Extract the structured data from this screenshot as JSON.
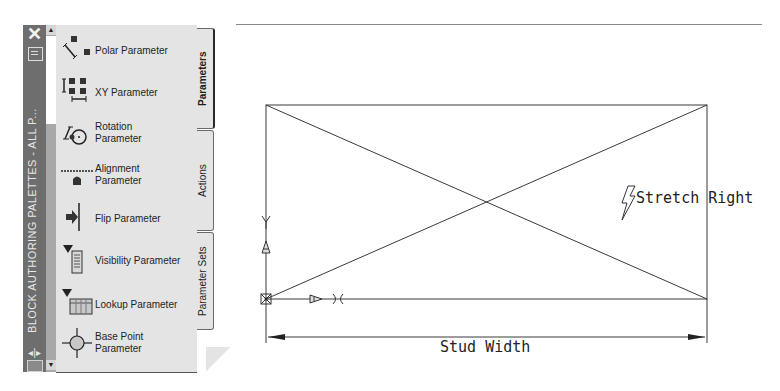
{
  "palette": {
    "title": "BLOCK AUTHORING PALETTES - ALL P...",
    "close_icon": "close-icon",
    "properties_icon": "properties-icon",
    "autohide_icon": "autohide-icon",
    "menu_icon": "palette-menu-icon",
    "scroll_up": "▲",
    "scroll_down": "▼",
    "items": [
      {
        "label_line1": "Polar Parameter",
        "label_line2": "",
        "icon": "polar-parameter-icon"
      },
      {
        "label_line1": "XY Parameter",
        "label_line2": "",
        "icon": "xy-parameter-icon"
      },
      {
        "label_line1": "Rotation",
        "label_line2": "Parameter",
        "icon": "rotation-parameter-icon"
      },
      {
        "label_line1": "Alignment",
        "label_line2": "Parameter",
        "icon": "alignment-parameter-icon"
      },
      {
        "label_line1": "Flip Parameter",
        "label_line2": "",
        "icon": "flip-parameter-icon"
      },
      {
        "label_line1": "Visibility Parameter",
        "label_line2": "",
        "icon": "visibility-parameter-icon"
      },
      {
        "label_line1": "Lookup Parameter",
        "label_line2": "",
        "icon": "lookup-parameter-icon"
      },
      {
        "label_line1": "Base Point",
        "label_line2": "Parameter",
        "icon": "base-point-parameter-icon"
      }
    ],
    "tabs": [
      {
        "label": "Parameters",
        "active": true
      },
      {
        "label": "Actions",
        "active": false
      },
      {
        "label": "Parameter Sets",
        "active": false
      }
    ]
  },
  "drawing": {
    "action_label": "Stretch Right",
    "action_icon": "lightning-bolt-icon",
    "dimension_label": "Stud Width",
    "rectangle": {
      "left": 266,
      "top": 105,
      "right": 707,
      "bottom": 299
    },
    "line_color": "#3a3a3a"
  }
}
